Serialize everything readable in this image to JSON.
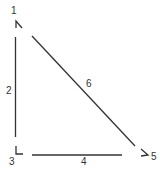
{
  "diagram": {
    "type": "triangle-graph",
    "nodes": [
      {
        "id": "1",
        "label": "1"
      },
      {
        "id": "3",
        "label": "3"
      },
      {
        "id": "5",
        "label": "5"
      }
    ],
    "edges": [
      {
        "id": "2",
        "label": "2",
        "from": "1",
        "to": "3"
      },
      {
        "id": "4",
        "label": "4",
        "from": "3",
        "to": "5"
      },
      {
        "id": "6",
        "label": "6",
        "from": "1",
        "to": "5"
      }
    ],
    "colors": {
      "stroke": "#333333",
      "background": "#ffffff"
    }
  }
}
